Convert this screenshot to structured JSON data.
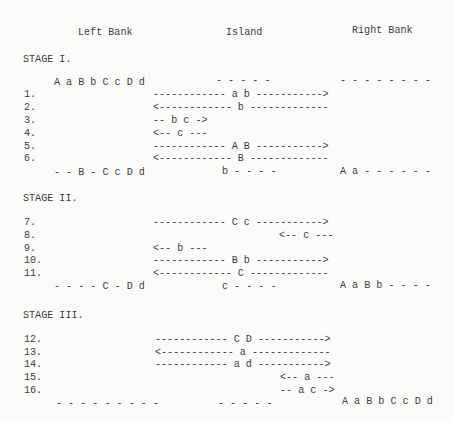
{
  "headers": {
    "left_bank": "Left Bank",
    "island": "Island",
    "right_bank": "Right Bank"
  },
  "stages": [
    {
      "title": "STAGE I.",
      "initial": {
        "left": "A a B b C c D d",
        "island": "- - - - -",
        "right": "- - - - - - - -"
      },
      "moves": [
        {
          "num": "1.",
          "text": "------------ a b ----------->"
        },
        {
          "num": "2.",
          "text": "<------------ b -------------"
        },
        {
          "num": "3.",
          "text": "-- b c ->"
        },
        {
          "num": "4.",
          "text": "<-- c ---"
        },
        {
          "num": "5.",
          "text": "------------ A B ----------->"
        },
        {
          "num": "6.",
          "text": "<------------ B -------------"
        }
      ],
      "final": {
        "left": "- - B - C c D d",
        "island": "b - - - -",
        "right": "A a - - - - - -"
      }
    },
    {
      "title": "STAGE II.",
      "moves": [
        {
          "num": "7.",
          "text": "------------ C c ----------->"
        },
        {
          "num": "8.",
          "text": "<-- c ---"
        },
        {
          "num": "9.",
          "text": "<-- b ---"
        },
        {
          "num": "10.",
          "text": "------------ B b ----------->"
        },
        {
          "num": "11.",
          "text": "<------------ C -------------"
        }
      ],
      "final": {
        "left": "- - - - C - D d",
        "island": "c - - - -",
        "right": "A a B b - - - -"
      }
    },
    {
      "title": "STAGE III.",
      "moves": [
        {
          "num": "12.",
          "text": "------------ C D ----------->"
        },
        {
          "num": "13.",
          "text": "<------------ a -------------"
        },
        {
          "num": "14.",
          "text": "------------ a d ----------->"
        },
        {
          "num": "15.",
          "text": "<-- a ---"
        },
        {
          "num": "16.",
          "text": "-- a c ->"
        }
      ],
      "final": {
        "left": "- - - - - - - - -",
        "island": "- - - - -",
        "right": "A a B b C c D d"
      }
    }
  ]
}
